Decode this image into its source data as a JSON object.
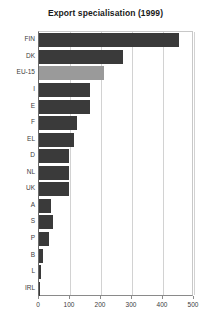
{
  "chart_data": {
    "type": "bar",
    "orientation": "horizontal",
    "title": "Export specialisation (1999)",
    "xlabel": "",
    "ylabel": "",
    "xlim": [
      0,
      500
    ],
    "xticks": [
      0,
      100,
      200,
      300,
      400,
      500
    ],
    "xtick_labels": [
      "0",
      "100",
      "200",
      "300",
      "400",
      "500"
    ],
    "grid": true,
    "grid_axis": "x",
    "legend": "none",
    "categories": [
      "FIN",
      "DK",
      "EU-15",
      "I",
      "E",
      "F",
      "EL",
      "D",
      "NL",
      "UK",
      "A",
      "S",
      "P",
      "B",
      "L",
      "IRL"
    ],
    "values": [
      451,
      271,
      210,
      165,
      164,
      123,
      113,
      98,
      97,
      96,
      39,
      45,
      32,
      13,
      6,
      3
    ],
    "bar_color": "#3a3a3a",
    "highlight_color": "#9a9a9a",
    "highlight_category": "EU-15",
    "bars": [
      {
        "label": "FIN",
        "value": 451,
        "highlight": false
      },
      {
        "label": "DK",
        "value": 271,
        "highlight": false
      },
      {
        "label": "EU-15",
        "value": 210,
        "highlight": true
      },
      {
        "label": "I",
        "value": 165,
        "highlight": false
      },
      {
        "label": "E",
        "value": 164,
        "highlight": false
      },
      {
        "label": "F",
        "value": 123,
        "highlight": false
      },
      {
        "label": "EL",
        "value": 113,
        "highlight": false
      },
      {
        "label": "D",
        "value": 98,
        "highlight": false
      },
      {
        "label": "NL",
        "value": 97,
        "highlight": false
      },
      {
        "label": "UK",
        "value": 96,
        "highlight": false
      },
      {
        "label": "A",
        "value": 39,
        "highlight": false
      },
      {
        "label": "S",
        "value": 45,
        "highlight": false
      },
      {
        "label": "P",
        "value": 32,
        "highlight": false
      },
      {
        "label": "B",
        "value": 13,
        "highlight": false
      },
      {
        "label": "L",
        "value": 6,
        "highlight": false
      },
      {
        "label": "IRL",
        "value": 3,
        "highlight": false
      }
    ]
  }
}
